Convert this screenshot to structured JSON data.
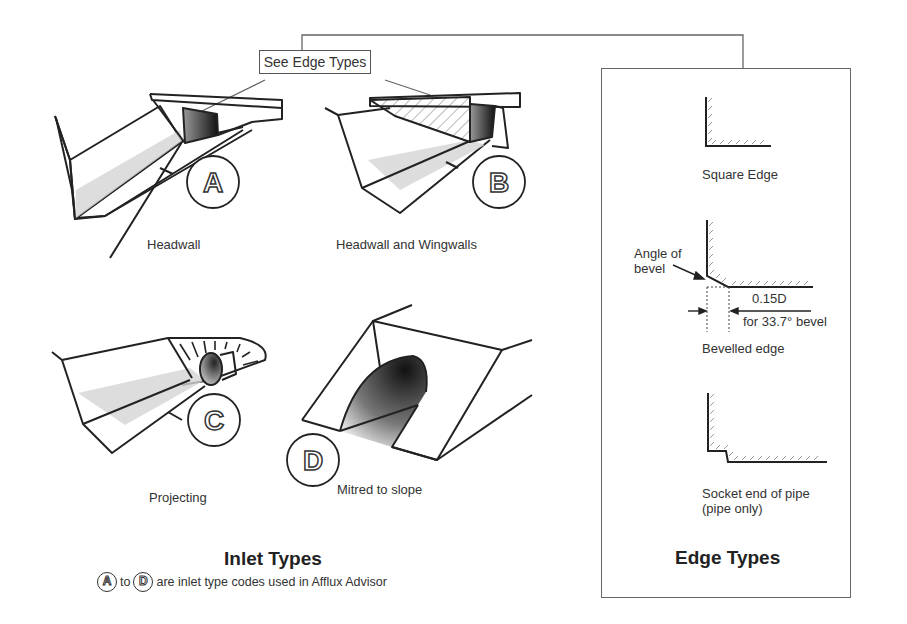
{
  "callout": {
    "label": "See Edge Types"
  },
  "inlet_types": {
    "title": "Inlet Types",
    "items": [
      {
        "code": "A",
        "label": "Headwall"
      },
      {
        "code": "B",
        "label": "Headwall and Wingwalls"
      },
      {
        "code": "C",
        "label": "Projecting"
      },
      {
        "code": "D",
        "label": "Mitred to slope"
      }
    ],
    "note": {
      "from_code": "A",
      "to_word": "to",
      "to_code": "D",
      "text": "are inlet type codes used in Afflux Advisor"
    }
  },
  "edge_types": {
    "title": "Edge Types",
    "items": [
      {
        "label": "Square Edge"
      },
      {
        "label": "Bevelled edge",
        "annotations": {
          "angle_label_line1": "Angle of",
          "angle_label_line2": "bevel",
          "dimension": "0.15D",
          "dimension_note": "for 33.7° bevel"
        }
      },
      {
        "label_line1": "Socket end of pipe",
        "label_line2": "(pipe only)"
      }
    ]
  }
}
